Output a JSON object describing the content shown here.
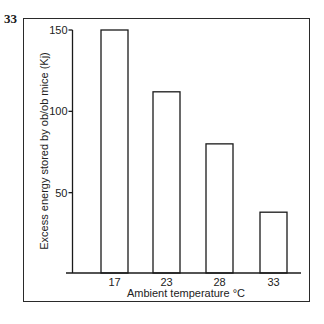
{
  "figure": {
    "number": "33"
  },
  "chart_data": {
    "type": "bar",
    "title": "",
    "categories": [
      "17",
      "23",
      "28",
      "33"
    ],
    "values": [
      150,
      112,
      80,
      38
    ],
    "xlabel": "Ambient temperature °C",
    "ylabel": "Excess energy stored by ob/ob mice (Kj)",
    "ylim": [
      0,
      150
    ],
    "yticks": [
      50,
      100,
      150
    ],
    "grid": false,
    "legend": null,
    "bar_fill": "#ffffff",
    "bar_stroke": "#1a1a1a"
  }
}
